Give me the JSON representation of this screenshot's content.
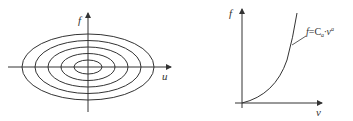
{
  "left_diagram": {
    "y_axis_label": "f",
    "x_axis_label": "u",
    "ellipse_count": 5,
    "description": "concentric ellipses centered at origin"
  },
  "right_diagram": {
    "y_axis_label": "f",
    "x_axis_label": "v",
    "curve_label_f": "f",
    "curve_label_eq": "=C",
    "curve_label_sub": "a",
    "curve_label_mid": "·v",
    "curve_label_sup": "a",
    "description": "power-law curve f = C_a · v^a"
  },
  "colors": {
    "line": "#333333",
    "background": "#ffffff"
  }
}
